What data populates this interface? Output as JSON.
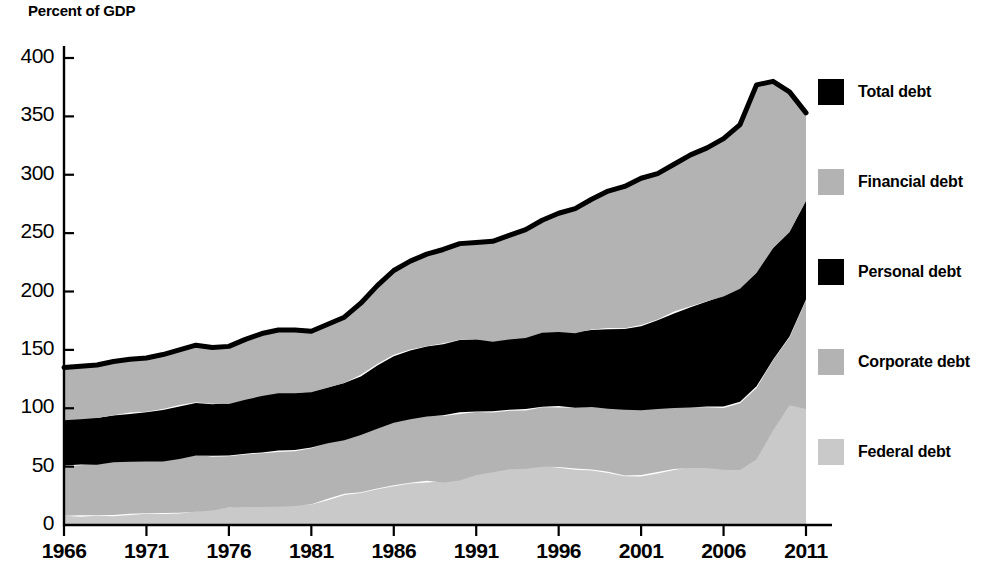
{
  "chart_data": {
    "type": "area",
    "title": "",
    "subtitle": "",
    "ylabel": "Percent of GDP",
    "xlabel": "",
    "stacked": true,
    "grid": false,
    "legend_position": "right",
    "xlim": [
      1966,
      2011
    ],
    "ylim": [
      0,
      400
    ],
    "ytick_labels": [
      "400",
      "350",
      "300",
      "250",
      "200",
      "150",
      "100",
      "50",
      "0"
    ],
    "yticks": [
      400,
      350,
      300,
      250,
      200,
      150,
      100,
      50,
      0
    ],
    "xtick_labels": [
      "1966",
      "1971",
      "1976",
      "1981",
      "1986",
      "1991",
      "1996",
      "2001",
      "2006",
      "2011"
    ],
    "xticks": [
      1966,
      1971,
      1976,
      1981,
      1986,
      1991,
      1996,
      2001,
      2006,
      2011
    ],
    "x": [
      1966,
      1967,
      1968,
      1969,
      1970,
      1971,
      1972,
      1973,
      1974,
      1975,
      1976,
      1977,
      1978,
      1979,
      1980,
      1981,
      1982,
      1983,
      1984,
      1985,
      1986,
      1987,
      1988,
      1989,
      1990,
      1991,
      1992,
      1993,
      1994,
      1995,
      1996,
      1997,
      1998,
      1999,
      2000,
      2001,
      2002,
      2003,
      2004,
      2005,
      2006,
      2007,
      2008,
      2009,
      2010,
      2011
    ],
    "series": [
      {
        "name": "Federal debt",
        "color": "#c9c9c9",
        "values": [
          8,
          8,
          8,
          8,
          9,
          10,
          10,
          10,
          11,
          13,
          15,
          16,
          16,
          16,
          17,
          18,
          22,
          26,
          28,
          31,
          34,
          36,
          37,
          37,
          39,
          43,
          46,
          48,
          49,
          50,
          50,
          48,
          47,
          45,
          42,
          42,
          45,
          48,
          49,
          49,
          48,
          48,
          57,
          81,
          103,
          100
        ]
      },
      {
        "name": "Corporate debt",
        "color": "#b3b3b3",
        "values": [
          42,
          43,
          44,
          46,
          46,
          45,
          45,
          47,
          49,
          46,
          44,
          45,
          46,
          47,
          47,
          48,
          48,
          47,
          50,
          52,
          54,
          55,
          56,
          57,
          57,
          54,
          51,
          50,
          50,
          51,
          51,
          52,
          54,
          55,
          57,
          57,
          55,
          53,
          52,
          52,
          53,
          57,
          61,
          60,
          58,
          93
        ]
      },
      {
        "name": "Personal debt",
        "color": "#000000",
        "values": [
          40,
          40,
          40,
          40,
          41,
          42,
          44,
          45,
          45,
          44,
          45,
          47,
          49,
          50,
          49,
          48,
          48,
          49,
          50,
          54,
          57,
          59,
          60,
          61,
          62,
          62,
          61,
          61,
          62,
          64,
          65,
          65,
          66,
          68,
          69,
          72,
          76,
          81,
          86,
          90,
          95,
          98,
          98,
          96,
          90,
          85
        ]
      },
      {
        "name": "Financial debt",
        "color": "#b3b3b3",
        "values": [
          45,
          45,
          45,
          46,
          46,
          46,
          47,
          48,
          49,
          49,
          49,
          51,
          53,
          54,
          54,
          52,
          54,
          56,
          62,
          68,
          73,
          76,
          79,
          81,
          83,
          83,
          85,
          89,
          92,
          96,
          101,
          106,
          112,
          118,
          122,
          126,
          125,
          127,
          130,
          132,
          135,
          140,
          161,
          143,
          120,
          75
        ]
      }
    ],
    "total_line": {
      "name": "Total debt",
      "color": "#000000",
      "values": [
        135,
        136,
        137,
        140,
        142,
        143,
        146,
        150,
        154,
        152,
        153,
        159,
        164,
        167,
        167,
        166,
        172,
        178,
        190,
        205,
        218,
        226,
        232,
        236,
        241,
        242,
        243,
        248,
        253,
        261,
        267,
        271,
        279,
        286,
        290,
        297,
        301,
        309,
        317,
        323,
        331,
        343,
        377,
        380,
        371,
        353
      ]
    },
    "legend": [
      {
        "label": "Total debt",
        "color": "#000000"
      },
      {
        "label": "Financial debt",
        "color": "#b3b3b3"
      },
      {
        "label": "Personal debt",
        "color": "#000000"
      },
      {
        "label": "Corporate debt",
        "color": "#b3b3b3"
      },
      {
        "label": "Federal debt",
        "color": "#c9c9c9"
      }
    ]
  }
}
